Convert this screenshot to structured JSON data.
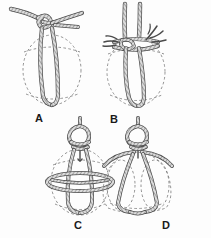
{
  "figure": {
    "background_color": "#fdfdfd",
    "ink_color": "#3a3a3a",
    "rope_fill_color": "#d8d8d8",
    "vessel_outline_color": "#6e6e6e",
    "label_color": "#1a1a1a"
  },
  "panels": [
    {
      "id": "A",
      "label": "A",
      "caption_position": "below-left",
      "subject": "jug-with-single-rope-bight",
      "elements": [
        "dashed oval jug outline",
        "rope entering from upper left",
        "overhand loop knot at top",
        "long rope bight hanging down center of jug",
        "short rope tail exiting to upper right"
      ]
    },
    {
      "id": "B",
      "label": "B",
      "caption_position": "below-left",
      "subject": "jug-with-two-standing-parts",
      "elements": [
        "dashed oval jug outline",
        "two parallel rope standing parts rising from knot",
        "horizontal knot collar across jug neck",
        "frayed rope ends branching left and right",
        "rope bight looping beneath jug base"
      ]
    },
    {
      "id": "C",
      "label": "C",
      "caption_position": "below-center",
      "subject": "jug-with-net-and-mid-ring",
      "elements": [
        "dashed oval jug outline",
        "loop knot at top with hanging eye",
        "two vertical ropes descending sides",
        "horizontal ellipse ring around jug middle",
        "rope crossing and bight under base"
      ]
    },
    {
      "id": "D",
      "label": "D",
      "caption_position": "below-center",
      "subject": "round-vessel-with-splayed-sling",
      "elements": [
        "dashed round vessel outline",
        "loop knot at top",
        "ropes arching outward over shoulders",
        "two ropes descending front of vessel",
        "rope passing under rounded base"
      ]
    }
  ],
  "labels": {
    "a": "A",
    "b": "B",
    "c": "C",
    "d": "D"
  }
}
